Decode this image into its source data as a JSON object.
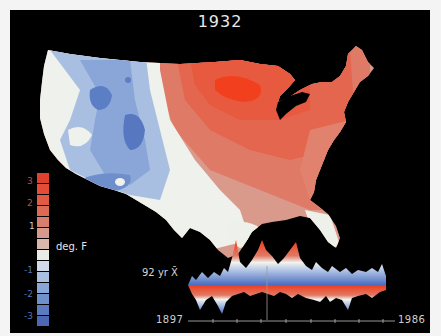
{
  "title": "1932",
  "legend": {
    "unit": "deg. F",
    "ticks": [
      "3",
      "2",
      "1",
      "-1",
      "-2",
      "-3"
    ],
    "swatches": [
      "#e0402e",
      "#e34c36",
      "#e05a44",
      "#dc6a55",
      "#d77e6c",
      "#d69a8c",
      "#dab6ac",
      "#e9ece4",
      "#cfd9ea",
      "#a9bfe0",
      "#8aa6d6",
      "#7090cc",
      "#5a7bc0",
      "#4a68b4"
    ]
  },
  "timeseries": {
    "label": "92 yr X̄",
    "start_year": "1897",
    "end_year": "1986",
    "current_year": "1932"
  },
  "colors": {
    "background": "#000000",
    "warm_max": "#f0401e",
    "warm_mid": "#de6a55",
    "neutral": "#eef0ea",
    "cool_mid": "#9db5dc",
    "cool_max": "#4f71b8"
  }
}
